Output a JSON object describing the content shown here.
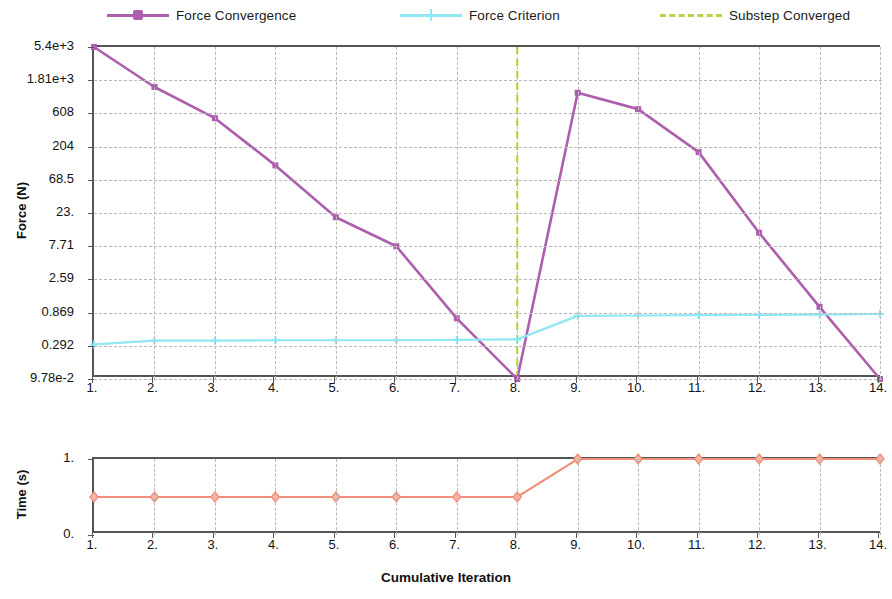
{
  "legend": {
    "items": [
      {
        "label": "Force Convergence",
        "color": "#ad5fad",
        "style": "solid-marker",
        "marker": "square"
      },
      {
        "label": "Force Criterion",
        "color": "#8fe8f4",
        "style": "solid-marker",
        "marker": "plus"
      },
      {
        "label": "Substep Converged",
        "color": "#b6d44a",
        "style": "dashed",
        "marker": "none"
      }
    ]
  },
  "chart_data": [
    {
      "type": "line",
      "title": "",
      "id": "force-convergence-chart",
      "xlabel": "Cumulative Iteration",
      "ylabel": "Force (N)",
      "yscale": "log",
      "grid": true,
      "legend_position": "top",
      "x": [
        1,
        2,
        3,
        4,
        5,
        6,
        7,
        8,
        9,
        10,
        11,
        12,
        13,
        14
      ],
      "xtick_labels": [
        "1.",
        "2.",
        "3.",
        "4.",
        "5.",
        "6.",
        "7.",
        "8.",
        "9.",
        "10.",
        "11.",
        "12.",
        "13.",
        "14."
      ],
      "ytick_labels": [
        "5.4e+3",
        "1.81e+3",
        "608",
        "204",
        "68.5",
        "23.",
        "7.71",
        "2.59",
        "0.869",
        "0.292",
        "9.78e-2"
      ],
      "ytick_values": [
        5400,
        1810,
        608,
        204,
        68.5,
        23.0,
        7.71,
        2.59,
        0.869,
        0.292,
        0.0978
      ],
      "ylim": [
        0.0978,
        5400
      ],
      "series": [
        {
          "name": "Force Convergence",
          "color": "#ad5fad",
          "marker": "square",
          "values": [
            5400,
            1450,
            520,
            110,
            20.0,
            7.7,
            0.72,
            0.0978,
            1200,
            700,
            170,
            12.0,
            1.05,
            0.0978
          ]
        },
        {
          "name": "Force Criterion",
          "color": "#8fe8f4",
          "marker": "plus",
          "values": [
            0.305,
            0.345,
            0.345,
            0.35,
            0.35,
            0.35,
            0.355,
            0.36,
            0.78,
            0.79,
            0.8,
            0.805,
            0.815,
            0.83
          ]
        }
      ],
      "vertical_markers": [
        {
          "name": "Substep Converged",
          "x": 8,
          "color": "#b6d44a",
          "style": "dashed"
        }
      ]
    },
    {
      "type": "line",
      "id": "time-chart",
      "xlabel": "Cumulative Iteration",
      "ylabel": "Time (s)",
      "yscale": "linear",
      "grid": true,
      "x": [
        1,
        2,
        3,
        4,
        5,
        6,
        7,
        8,
        9,
        10,
        11,
        12,
        13,
        14
      ],
      "xtick_labels": [
        "1.",
        "2.",
        "3.",
        "4.",
        "5.",
        "6.",
        "7.",
        "8.",
        "9.",
        "10.",
        "11.",
        "12.",
        "13.",
        "14."
      ],
      "ytick_labels": [
        "1.",
        "0."
      ],
      "ytick_values": [
        1.0,
        0.0
      ],
      "ylim": [
        0,
        1
      ],
      "series": [
        {
          "name": "Time",
          "color": "#f08f7a",
          "marker": "diamond",
          "values": [
            0.5,
            0.5,
            0.5,
            0.5,
            0.5,
            0.5,
            0.5,
            0.5,
            1.0,
            1.0,
            1.0,
            1.0,
            1.0,
            1.0
          ]
        }
      ]
    }
  ]
}
